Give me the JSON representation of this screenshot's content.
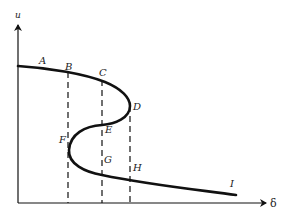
{
  "diagram": {
    "type": "S-shaped bifurcation curve",
    "axes": {
      "y_label": "u",
      "x_label": "δ"
    },
    "point_labels": {
      "A": "A",
      "B": "B",
      "C": "C",
      "D": "D",
      "E": "E",
      "F": "F",
      "G": "G",
      "H": "H",
      "I": "I"
    },
    "dashed_lines": [
      {
        "name": "B-F",
        "x_from": "B",
        "to": "axis"
      },
      {
        "name": "C-E-G",
        "x_from": "C",
        "to": "axis"
      },
      {
        "name": "D-H",
        "x_from": "D",
        "to": "axis"
      }
    ],
    "colors": {
      "stroke": "#111111",
      "background": "#ffffff"
    }
  }
}
